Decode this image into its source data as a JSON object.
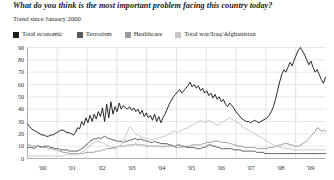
{
  "chart_data": {
    "type": "line",
    "title": "What do you think is the most important problem facing this country today?",
    "subtitle": "Trend since January 2000",
    "xlabel": "",
    "ylabel": "",
    "ylim": [
      0,
      90
    ],
    "yticks": [
      0,
      10,
      20,
      30,
      40,
      50,
      60,
      70,
      80,
      90
    ],
    "ytick_labels": [
      "0",
      "10",
      "20",
      "30",
      "40",
      "50",
      "60",
      "70",
      "80",
      "90"
    ],
    "xlim": [
      2000,
      2010
    ],
    "xticks": [
      2000,
      2001,
      2002,
      2003,
      2004,
      2005,
      2006,
      2007,
      2008,
      2009
    ],
    "xtick_labels": [
      "'00",
      "'01",
      "'02",
      "'03",
      "'04",
      "'05",
      "'06",
      "'07",
      "'08",
      "'09"
    ],
    "grid": true,
    "legend_position": "top",
    "colors": {
      "total_economic": "#1d1d1d",
      "terrorism": "#575757",
      "healthcare": "#9a9a9a",
      "total_war": "#c6c6c6",
      "gridline": "#d8d8d8",
      "axis": "#8c8c8c",
      "background": "#ffffff"
    },
    "series": [
      {
        "name": "Total economic",
        "color": "#1d1d1d",
        "values": [
          28,
          26,
          24,
          23,
          22,
          21,
          20,
          19,
          19,
          18,
          18,
          19,
          19,
          20,
          21,
          22,
          23,
          23,
          22,
          21,
          21,
          20,
          19,
          21,
          25,
          24,
          30,
          27,
          33,
          29,
          35,
          30,
          36,
          32,
          38,
          34,
          41,
          30,
          44,
          33,
          46,
          36,
          42,
          38,
          45,
          40,
          43,
          41,
          40,
          42,
          39,
          41,
          38,
          40,
          36,
          39,
          34,
          37,
          33,
          35,
          31,
          36,
          30,
          34,
          29,
          33,
          36,
          40,
          44,
          47,
          50,
          52,
          54,
          56,
          53,
          55,
          57,
          59,
          62,
          58,
          60,
          57,
          59,
          55,
          57,
          53,
          55,
          51,
          53,
          49,
          52,
          48,
          50,
          46,
          48,
          44,
          42,
          45,
          43,
          41,
          38,
          36,
          34,
          32,
          31,
          30,
          30,
          29,
          30,
          31,
          30,
          29,
          30,
          31,
          32,
          33,
          35,
          38,
          42,
          48,
          55,
          62,
          68,
          72,
          70,
          74,
          78,
          75,
          80,
          84,
          88,
          90,
          87,
          84,
          80,
          76,
          79,
          74,
          70,
          72,
          68,
          64,
          61,
          66
        ]
      },
      {
        "name": "Terrorism",
        "color": "#575757",
        "values": [
          9,
          9,
          9,
          8,
          9,
          10,
          10,
          9,
          10,
          10,
          10,
          9,
          9,
          8,
          8,
          8,
          7,
          7,
          7,
          7,
          6,
          6,
          6,
          6,
          6,
          7,
          8,
          9,
          11,
          12,
          14,
          15,
          16,
          16,
          17,
          16,
          17,
          18,
          17,
          16,
          16,
          15,
          15,
          14,
          14,
          14,
          13,
          14,
          14,
          15,
          15,
          16,
          16,
          15,
          16,
          15,
          15,
          14,
          14,
          13,
          13,
          14,
          13,
          13,
          12,
          12,
          12,
          12,
          11,
          11,
          10,
          10,
          11,
          11,
          10,
          10,
          9,
          9,
          9,
          9,
          9,
          8,
          8,
          8,
          9,
          9,
          10,
          11,
          11,
          10,
          10,
          9,
          9,
          8,
          8,
          8,
          8,
          8,
          8,
          7,
          7,
          7,
          7,
          6,
          6,
          6,
          6,
          6,
          6,
          6,
          5,
          5,
          5,
          5,
          4,
          4,
          4,
          4,
          4,
          4,
          4,
          4,
          4,
          4,
          4,
          4,
          4,
          4,
          4,
          4,
          4,
          4,
          4,
          4,
          4,
          4,
          4,
          4,
          4,
          4,
          4,
          4,
          4,
          4
        ]
      },
      {
        "name": "Healthcare",
        "color": "#9a9a9a",
        "values": [
          11,
          11,
          10,
          10,
          10,
          10,
          9,
          9,
          9,
          9,
          8,
          8,
          8,
          7,
          7,
          6,
          6,
          5,
          5,
          5,
          4,
          4,
          4,
          4,
          4,
          4,
          4,
          4,
          5,
          5,
          5,
          5,
          5,
          6,
          6,
          6,
          7,
          7,
          8,
          8,
          8,
          9,
          9,
          9,
          10,
          10,
          10,
          10,
          11,
          11,
          11,
          11,
          12,
          11,
          11,
          11,
          11,
          10,
          10,
          10,
          10,
          10,
          10,
          10,
          10,
          9,
          10,
          10,
          10,
          10,
          10,
          9,
          9,
          9,
          9,
          10,
          10,
          10,
          10,
          11,
          11,
          11,
          11,
          11,
          12,
          12,
          13,
          13,
          13,
          14,
          14,
          14,
          14,
          13,
          13,
          13,
          13,
          12,
          12,
          11,
          11,
          10,
          10,
          10,
          9,
          9,
          9,
          9,
          9,
          9,
          8,
          8,
          8,
          8,
          8,
          8,
          9,
          9,
          9,
          10,
          10,
          11,
          11,
          12,
          12,
          12,
          11,
          11,
          10,
          10,
          10,
          11,
          12,
          13,
          14,
          16,
          18,
          20,
          22,
          25,
          24,
          22,
          23,
          22
        ]
      },
      {
        "name": "Total war/Iraq/Afghanistan",
        "color": "#c6c6c6",
        "values": [
          2,
          2,
          2,
          2,
          2,
          2,
          2,
          2,
          2,
          2,
          2,
          2,
          2,
          2,
          2,
          2,
          2,
          2,
          3,
          3,
          3,
          3,
          3,
          3,
          3,
          4,
          5,
          6,
          8,
          9,
          10,
          12,
          13,
          14,
          14,
          13,
          13,
          12,
          11,
          10,
          9,
          8,
          8,
          9,
          10,
          12,
          15,
          18,
          22,
          26,
          24,
          22,
          20,
          19,
          18,
          17,
          17,
          16,
          16,
          15,
          15,
          16,
          16,
          17,
          17,
          18,
          18,
          19,
          20,
          21,
          22,
          22,
          21,
          22,
          23,
          24,
          24,
          25,
          26,
          27,
          28,
          29,
          30,
          31,
          30,
          29,
          30,
          31,
          30,
          29,
          28,
          27,
          28,
          29,
          30,
          31,
          32,
          33,
          32,
          31,
          30,
          29,
          28,
          26,
          25,
          24,
          23,
          22,
          21,
          20,
          19,
          18,
          17,
          16,
          15,
          14,
          13,
          12,
          11,
          10,
          10,
          9,
          9,
          8,
          8,
          8,
          8,
          7,
          7,
          7,
          7,
          7,
          7,
          7,
          7,
          7,
          7,
          7,
          7,
          7,
          7,
          7,
          7,
          7
        ]
      }
    ]
  },
  "legend": {
    "items": [
      {
        "label": "Total economic",
        "color": "#1d1d1d"
      },
      {
        "label": "Terrorism",
        "color": "#575757"
      },
      {
        "label": "Healthcare",
        "color": "#9a9a9a"
      },
      {
        "label": "Total war/Iraq/Afghanistan",
        "color": "#c6c6c6"
      }
    ]
  }
}
